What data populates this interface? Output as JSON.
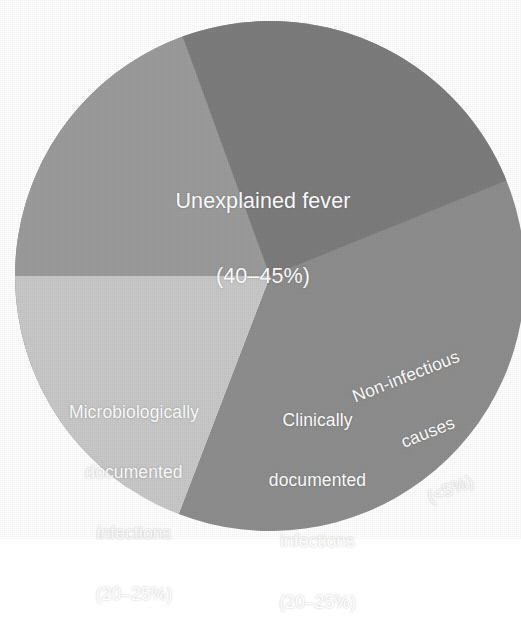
{
  "chart_data": {
    "type": "pie",
    "title": "",
    "subtitle": "",
    "xlabel": "",
    "ylabel": "",
    "legend_position": "none",
    "grid": false,
    "labels_inside_slices": true,
    "center": {
      "x": 270,
      "y": 276
    },
    "radius": 255,
    "categories": [
      "Unexplained fever",
      "Microbiologically documented infections",
      "Clinically documented infections",
      "Non-infectious causes"
    ],
    "value_labels": [
      "(40–45%)",
      "(20–25%)",
      "(20–25%)",
      "(<5%)"
    ],
    "values": [
      42.5,
      22.5,
      22.5,
      4.0
    ],
    "ranges": [
      {
        "min": 40,
        "max": 45
      },
      {
        "min": 20,
        "max": 25
      },
      {
        "min": 20,
        "max": 25
      },
      {
        "min": 0,
        "max": 5
      }
    ],
    "colors": [
      "#8e8e8e",
      "#c9c9c9",
      "#9c9c9c",
      "#7d7d7d"
    ],
    "slices": [
      {
        "name": "unexplained-fever",
        "label": "Unexplained fever",
        "value_label": "(40–45%)",
        "value": 42.5,
        "color": "#8e8e8e",
        "start_angle_deg": 249,
        "end_angle_deg": 596,
        "label_lines": [
          "Unexplained fever",
          "(40–45%)"
        ]
      },
      {
        "name": "microbiologically-documented-infections",
        "label": "Microbiologically documented infections",
        "value_label": "(20–25%)",
        "value": 22.5,
        "color": "#c9c9c9",
        "start_angle_deg": 180,
        "end_angle_deg": 249,
        "label_lines": [
          "Microbiologically",
          "documented",
          "infections",
          "(20–25%)"
        ]
      },
      {
        "name": "clinically-documented-infections",
        "label": "Clinically documented infections",
        "value_label": "(20–25%)",
        "value": 22.5,
        "color": "#9c9c9c",
        "start_angle_deg": 110,
        "end_angle_deg": 180,
        "label_lines": [
          "Clinically",
          "documented",
          "infections",
          "(20–25%)"
        ]
      },
      {
        "name": "non-infectious-causes",
        "label": "Non-infectious causes",
        "value_label": "(<5%)",
        "value": 4.0,
        "color": "#7d7d7d",
        "start_angle_deg": 22,
        "end_angle_deg": 110,
        "label_lines": [
          "Non-infectious",
          "causes",
          "(<5%)"
        ],
        "label_rotation_deg": -21.5
      }
    ],
    "background_color": "#ffffff",
    "label_text_color": "#ffffff"
  },
  "labels": {
    "unexplained_fever": {
      "line1": "Unexplained fever",
      "line2": "(40–45%)"
    },
    "microbiologically_documented": {
      "line1": "Microbiologically",
      "line2": "documented",
      "line3": "infections",
      "line4": "(20–25%)"
    },
    "clinically_documented": {
      "line1": "Clinically",
      "line2": "documented",
      "line3": "infections",
      "line4": "(20–25%)"
    },
    "non_infectious": {
      "line1": "Non-infectious",
      "line2": "causes",
      "line3": "(<5%)"
    }
  }
}
